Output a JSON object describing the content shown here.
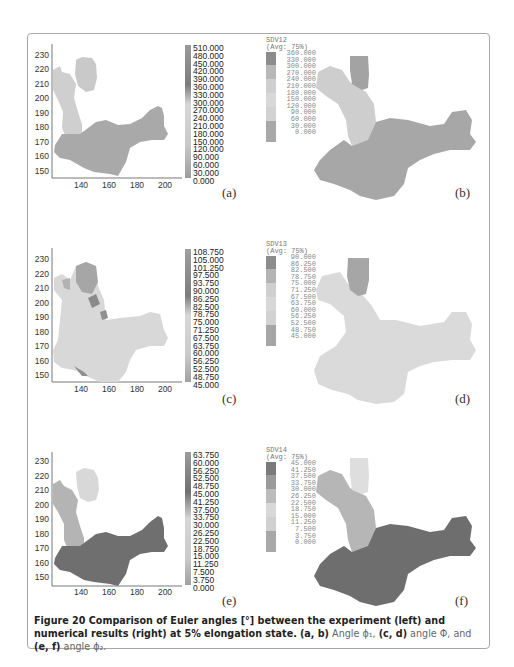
{
  "figure": {
    "caption": {
      "bold_prefix": "Figure 20 Comparison of Euler angles [°] between the experiment (left) and numerical results (right) at 5% elongation state.",
      "part1_bold": "(a, b)",
      "part1_text": "Angle ϕ₁,",
      "part2_bold": "(c, d)",
      "part2_text": "angle Φ, and",
      "part3_bold": "(e, f)",
      "part3_text": "angle ϕ₂."
    },
    "panels": {
      "a": {
        "label": "(a)"
      },
      "b": {
        "label": "(b)"
      },
      "c": {
        "label": "(c)"
      },
      "d": {
        "label": "(d)"
      },
      "e": {
        "label": "(e)"
      },
      "f": {
        "label": "(f)"
      }
    },
    "axes": {
      "yticks": [
        "230",
        "220",
        "210",
        "200",
        "190",
        "180",
        "170",
        "160",
        "150"
      ],
      "xticks": [
        "140",
        "160",
        "180",
        "200"
      ]
    },
    "colorbars_experiment": {
      "a": [
        "510.000",
        "480.000",
        "450.000",
        "420.000",
        "390.000",
        "360.000",
        "330.000",
        "300.000",
        "270.000",
        "240.000",
        "210.000",
        "180.000",
        "150.000",
        "120.000",
        "90.000",
        "60.000",
        "30.000",
        "0.000"
      ],
      "c": [
        "108.750",
        "105.000",
        "101.250",
        "97.500",
        "93.750",
        "90.000",
        "86.250",
        "82.500",
        "78.750",
        "75.000",
        "71.250",
        "67.500",
        "63.750",
        "60.000",
        "56.250",
        "52.500",
        "48.750",
        "45.000"
      ],
      "e": [
        "63.750",
        "60.000",
        "56.250",
        "52.500",
        "48.750",
        "45.000",
        "41.250",
        "37.500",
        "33.750",
        "30.000",
        "26.250",
        "22.500",
        "18.750",
        "15.000",
        "11.250",
        "7.500",
        "3.750",
        "0.000"
      ]
    },
    "legends_simulation": {
      "b": {
        "variable": "SDV12",
        "avg": "(Avg: 75%)",
        "values": [
          "360.000",
          "330.000",
          "300.000",
          "270.000",
          "240.000",
          "210.000",
          "180.000",
          "150.000",
          "120.000",
          "90.000",
          "60.000",
          "30.000",
          "0.000"
        ]
      },
      "d": {
        "variable": "SDV13",
        "avg": "(Avg: 75%)",
        "values": [
          "90.000",
          "86.250",
          "82.500",
          "78.750",
          "75.000",
          "71.250",
          "67.500",
          "63.750",
          "60.000",
          "56.250",
          "52.500",
          "48.750",
          "45.000"
        ]
      },
      "f": {
        "variable": "SDV14",
        "avg": "(Avg: 75%)",
        "values": [
          "45.000",
          "41.250",
          "37.500",
          "33.750",
          "30.000",
          "26.250",
          "22.500",
          "18.750",
          "15.000",
          "11.250",
          "7.500",
          "3.750",
          "0.000"
        ]
      }
    },
    "colors": {
      "frame": "#a8a8a8",
      "light_region": "#d6d6d6",
      "mid_region": "#b4b4b4",
      "dark_region": "#7a7a7a",
      "pale_region": "#e2e2e2"
    }
  }
}
